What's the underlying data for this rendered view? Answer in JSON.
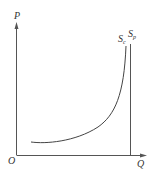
{
  "diagram": {
    "type": "supply-curves",
    "axes": {
      "y_label": "P",
      "x_label": "Q",
      "origin_label": "O"
    },
    "curves": [
      {
        "name": "S",
        "subscript": "c",
        "description": "convex curve rising steeply"
      },
      {
        "name": "S",
        "subscript": "p",
        "description": "vertical line"
      }
    ],
    "colors": {
      "axis": "#555555",
      "curve": "#444444",
      "text": "#333333"
    }
  }
}
